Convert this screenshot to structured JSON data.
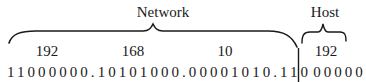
{
  "diagram": {
    "labels": {
      "network": "Network",
      "host": "Host"
    },
    "octets": [
      {
        "decimal": "192",
        "binary": "11000000"
      },
      {
        "decimal": "168",
        "binary": "10101000"
      },
      {
        "decimal": "10",
        "binary": "00001010"
      },
      {
        "decimal": "192",
        "binary": "11000000"
      }
    ],
    "binary_network_part": "11000000.10101000.00001010.110",
    "binary_host_part": "00000",
    "prefix_length": 27,
    "colors": {
      "text": "#1a1a1a",
      "lines": "#1a1a1a",
      "background": "#ffffff"
    }
  }
}
